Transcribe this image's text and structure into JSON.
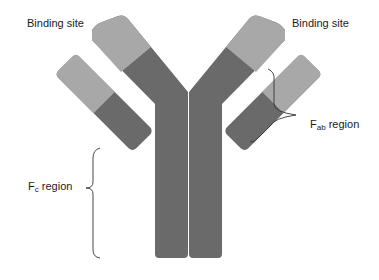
{
  "diagram": {
    "labels": {
      "binding_site_left": "Binding site",
      "binding_site_right": "Binding site",
      "fab_main": "F",
      "fab_sub": "ab",
      "fab_suffix": " region",
      "fc_main": "F",
      "fc_sub": "c",
      "fc_suffix": " region"
    },
    "colors": {
      "variable_region": "#a8a8a8",
      "constant_region": "#6a6a6a",
      "bracket": "#333333",
      "text": "#1a1a1a"
    }
  }
}
